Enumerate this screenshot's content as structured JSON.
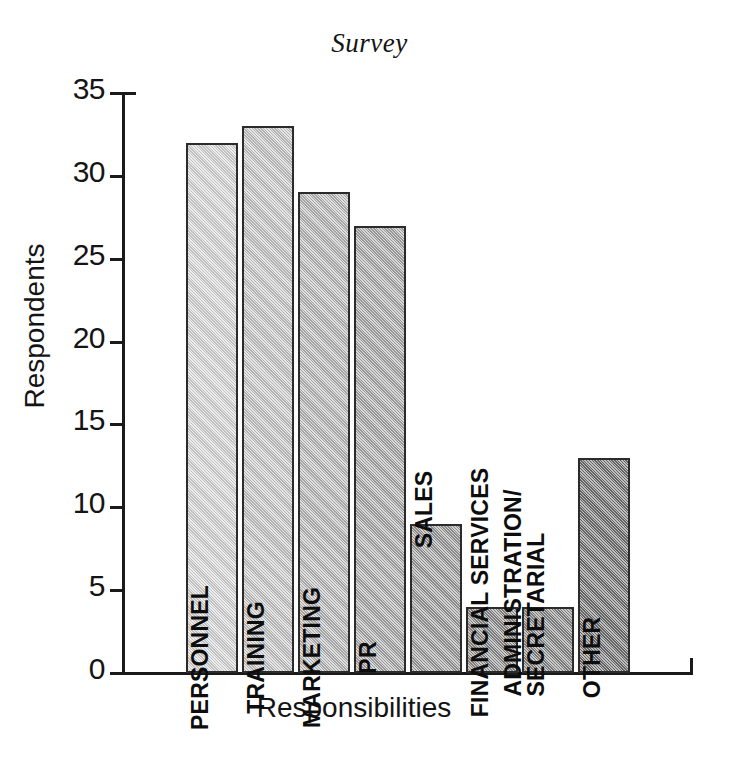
{
  "chart_data": {
    "type": "bar",
    "title": "Survey",
    "xlabel": "Responsibilities",
    "ylabel": "Respondents",
    "categories": [
      "PERSONNEL",
      "TRAINING",
      "MARKETING",
      "PR",
      "SALES",
      "FINANCIAL SERVICES",
      "ADMINISTRATION/\nSECRETARIAL",
      "OTHER"
    ],
    "values": [
      32,
      33,
      29,
      27,
      9,
      4,
      4,
      13
    ],
    "ylim": [
      0,
      35
    ],
    "yticks": [
      0,
      5,
      10,
      15,
      20,
      25,
      30,
      35
    ],
    "ytick_labels": [
      "0",
      "5",
      "10",
      "15",
      "20",
      "25",
      "30",
      "35"
    ],
    "grid": false,
    "legend": false,
    "bar_colors": [
      "#d9d9d9",
      "#c9c9c9",
      "#bababa",
      "#ababab",
      "#9c9c9c",
      "#8d8d8d",
      "#898989",
      "#717171"
    ],
    "bar_border_color": "#2b2b2b",
    "axis_color": "#1a1a1a",
    "background": "#ffffff"
  }
}
